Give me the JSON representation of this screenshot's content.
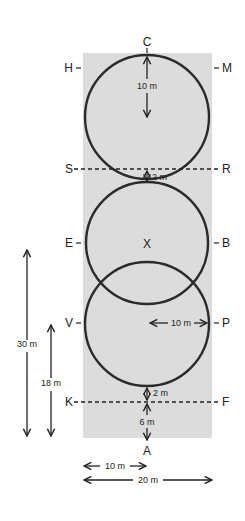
{
  "diagram": {
    "arena": {
      "width_m": 20,
      "length_m": 40,
      "fill": "#dcdcdc",
      "line": "#2b2b2b"
    },
    "letters": {
      "top": "C",
      "bottom": "A",
      "left": [
        "H",
        "S",
        "E",
        "V",
        "K"
      ],
      "right": [
        "M",
        "R",
        "B",
        "P",
        "F"
      ],
      "center": "X"
    },
    "dimensions": {
      "radius_top": "10 m",
      "gap_top": "2 m",
      "radius_lower": "10 m",
      "gap_bottom": "2 m",
      "end_distance": "6 m",
      "left_outer": "30 m",
      "left_inner": "18 m",
      "width_half": "10 m",
      "width_full": "20 m"
    }
  }
}
